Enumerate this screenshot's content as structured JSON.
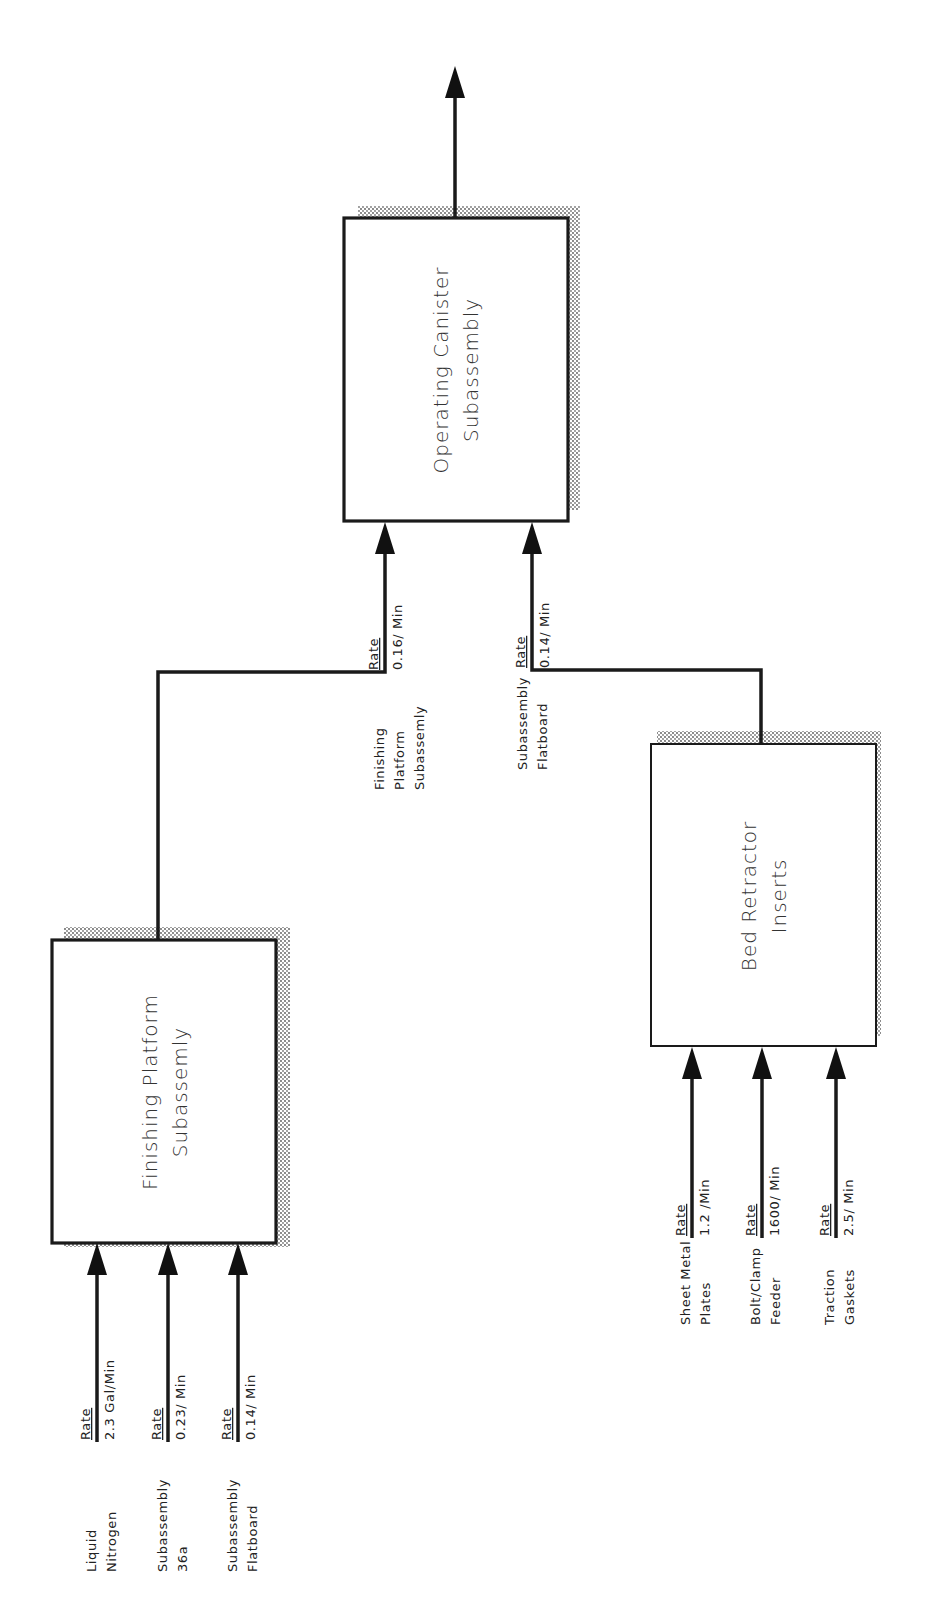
{
  "diagram": {
    "colors": {
      "stroke": "#1a1a1a",
      "text": "#333333",
      "shadow_dots": "#555555",
      "background": "#ffffff"
    },
    "nodes": [
      {
        "id": "operating-canister",
        "title_line1": "Operating Canister",
        "title_line2": "Subassembly"
      },
      {
        "id": "finishing-platform",
        "title_line1": "Finishing Platform",
        "title_line2": "Subassemly"
      },
      {
        "id": "bed-retractor",
        "title_line1": "Bed Retractor",
        "title_line2": "Inserts"
      }
    ],
    "output_arrow": {
      "from": "operating-canister",
      "label": ""
    },
    "connections": [
      {
        "from": "finishing-platform",
        "to": "operating-canister",
        "rate_label": "Rate",
        "rate_value": "0.16/ Min",
        "source_line1": "Finishing",
        "source_line2": "Platform",
        "source_line3": "Subassemly"
      },
      {
        "from": "bed-retractor",
        "to": "operating-canister",
        "rate_label": "Rate",
        "rate_value": "0.14/ Min",
        "source_line1": "Subassembly",
        "source_line2": "Flatboard"
      }
    ],
    "finishing_inputs": [
      {
        "rate_label": "Rate",
        "rate_value": "2.3 Gal/Min",
        "source_line1": "Liquid",
        "source_line2": "Nitrogen"
      },
      {
        "rate_label": "Rate",
        "rate_value": "0.23/ Min",
        "source_line1": "Subassembly",
        "source_line2": "36a"
      },
      {
        "rate_label": "Rate",
        "rate_value": "0.14/ Min",
        "source_line1": "Subassembly",
        "source_line2": "Flatboard"
      }
    ],
    "bed_inputs": [
      {
        "rate_label": "Rate",
        "rate_value": "1.2 /Min",
        "source_line1": "Sheet Metal",
        "source_line2": "Plates"
      },
      {
        "rate_label": "Rate",
        "rate_value": "1600/ Min",
        "source_line1": "Bolt/Clamp",
        "source_line2": "Feeder"
      },
      {
        "rate_label": "Rate",
        "rate_value": "2.5/ Min",
        "source_line1": "Traction",
        "source_line2": "Gaskets"
      }
    ]
  }
}
